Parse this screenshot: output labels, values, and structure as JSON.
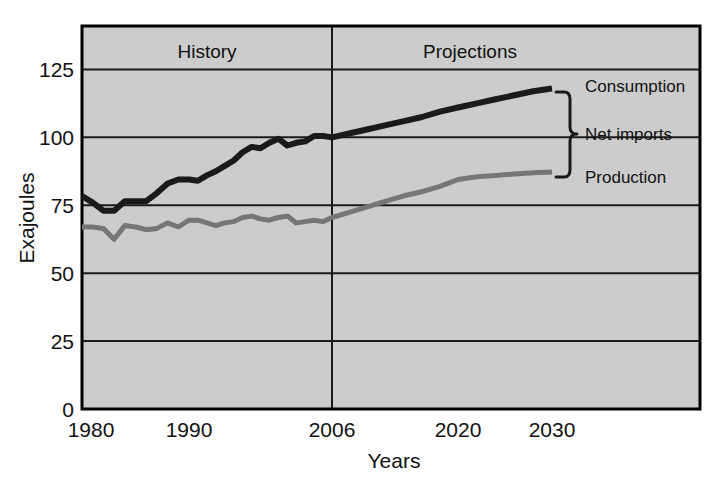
{
  "chart_data": {
    "type": "line",
    "title": "",
    "xlabel": "Years",
    "ylabel": "Exajoules",
    "xlim": [
      1980,
      2030
    ],
    "ylim": [
      0,
      141
    ],
    "yticks": [
      0,
      25,
      50,
      75,
      100,
      125
    ],
    "xticks": [
      1980,
      1990,
      2006,
      2020,
      2030
    ],
    "xtick_labels": [
      "1980",
      "1990",
      "2006",
      "2020",
      "2030"
    ],
    "ytick_labels": [
      "0",
      "25",
      "50",
      "75",
      "100",
      "125"
    ],
    "grid": true,
    "grid_axis": "y",
    "legend": "inline-annotations",
    "plot_background": "#cccccc",
    "regions": [
      {
        "label": "History",
        "from": 1980,
        "to": 2006
      },
      {
        "label": "Projections",
        "from": 2006,
        "to": 2030
      }
    ],
    "divider_year": 2006,
    "annotations": [
      {
        "name": "consumption-label",
        "text": "Consumption",
        "year": 2030,
        "value": 118
      },
      {
        "name": "net-imports-label",
        "text": "Net imports",
        "year": 2030,
        "value": 102
      },
      {
        "name": "production-label",
        "text": "Production",
        "year": 2030,
        "value": 87
      },
      {
        "name": "net-imports-bracket",
        "text": "",
        "from_value": 118,
        "to_value": 87
      }
    ],
    "series": [
      {
        "name": "Consumption",
        "color": "#1a1a1a",
        "x": [
          1980,
          1981,
          1982,
          1983,
          1984,
          1985,
          1986,
          1987,
          1988,
          1989,
          1990,
          1991,
          1992,
          1993,
          1994,
          1995,
          1996,
          1997,
          1998,
          1999,
          2000,
          2001,
          2002,
          2003,
          2004,
          2005,
          2006,
          2008,
          2010,
          2012,
          2014,
          2016,
          2018,
          2020,
          2022,
          2024,
          2026,
          2028,
          2030
        ],
        "values": [
          78.4,
          76.0,
          73.0,
          73.0,
          76.5,
          76.5,
          76.5,
          79.5,
          83.0,
          84.5,
          84.5,
          84.0,
          86.0,
          87.5,
          89.5,
          91.5,
          94.5,
          96.5,
          96.0,
          98.0,
          99.5,
          97.0,
          98.0,
          98.5,
          100.5,
          100.5,
          100.0,
          101.5,
          103.0,
          104.5,
          106.0,
          107.5,
          109.5,
          111.0,
          112.5,
          114.0,
          115.5,
          117.0,
          118.0
        ]
      },
      {
        "name": "Production",
        "color": "#767676",
        "x": [
          1980,
          1981,
          1982,
          1983,
          1984,
          1985,
          1986,
          1987,
          1988,
          1989,
          1990,
          1991,
          1992,
          1993,
          1994,
          1995,
          1996,
          1997,
          1998,
          1999,
          2000,
          2001,
          2002,
          2003,
          2004,
          2005,
          2006,
          2008,
          2010,
          2012,
          2014,
          2016,
          2018,
          2020,
          2022,
          2024,
          2026,
          2028,
          2030
        ],
        "values": [
          67.0,
          67.0,
          66.5,
          62.5,
          67.5,
          67.0,
          66.0,
          66.5,
          68.5,
          67.0,
          69.5,
          69.5,
          68.5,
          67.5,
          68.5,
          69.0,
          70.5,
          71.0,
          70.0,
          69.5,
          70.5,
          71.0,
          68.5,
          69.0,
          69.5,
          69.0,
          70.5,
          72.5,
          74.5,
          76.5,
          78.5,
          80.0,
          82.0,
          84.5,
          85.5,
          86.0,
          86.5,
          87.0,
          87.3
        ]
      }
    ]
  },
  "axes": {
    "ylabel": "Exajoules",
    "xlabel": "Years"
  },
  "ticks": {
    "y": [
      "125",
      "100",
      "75",
      "50",
      "25",
      "0"
    ],
    "x": [
      "1980",
      "1990",
      "2006",
      "2020",
      "2030"
    ]
  },
  "regions": {
    "history": "History",
    "projections": "Projections"
  },
  "labels": {
    "consumption": "Consumption",
    "net_imports": "Net imports",
    "production": "Production"
  },
  "colors": {
    "plot_background": "#cccccc",
    "consumption_line": "#1a1a1a",
    "production_line": "#767676",
    "axis": "#000000",
    "page_background": "#ffffff"
  }
}
